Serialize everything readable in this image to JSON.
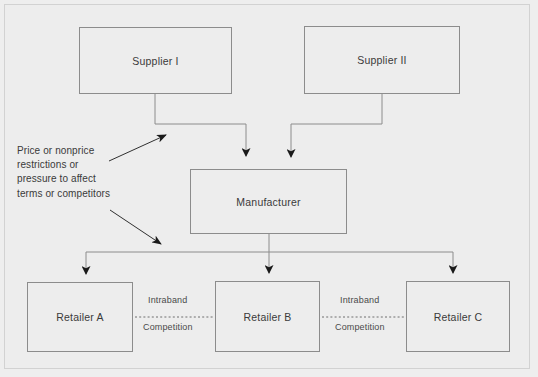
{
  "diagram": {
    "background_color": "#ededed",
    "line_color": "#8c8c8c",
    "arrow_color": "#1a1a1a",
    "text_color": "#3a3a3a"
  },
  "nodes": [
    {
      "id": "supplier-1",
      "label": "Supplier I",
      "x": 79,
      "y": 27,
      "w": 153,
      "h": 67
    },
    {
      "id": "supplier-2",
      "label": "Supplier II",
      "x": 304,
      "y": 26,
      "w": 156,
      "h": 68
    },
    {
      "id": "manufacturer",
      "label": "Manufacturer",
      "x": 190,
      "y": 169,
      "w": 157,
      "h": 65
    },
    {
      "id": "retailer-a",
      "label": "Retailer A",
      "x": 27,
      "y": 282,
      "w": 106,
      "h": 70
    },
    {
      "id": "retailer-b",
      "label": "Retailer B",
      "x": 215,
      "y": 281,
      "w": 105,
      "h": 71
    },
    {
      "id": "retailer-c",
      "label": "Retailer C",
      "x": 406,
      "y": 281,
      "w": 104,
      "h": 71
    }
  ],
  "edge_labels": [
    {
      "id": "intraband-ab-top",
      "text": "Intraband",
      "x": 148,
      "y": 295
    },
    {
      "id": "competition-ab-bottom",
      "text": "Competition",
      "x": 143,
      "y": 322
    },
    {
      "id": "intraband-bc-top",
      "text": "Intraband",
      "x": 340,
      "y": 295
    },
    {
      "id": "competition-bc-bottom",
      "text": "Competition",
      "x": 335,
      "y": 322
    }
  ],
  "annotation": {
    "id": "restriction-note",
    "lines": [
      "Price or nonprice",
      "restrictions or",
      "pressure to affect",
      "terms or competitors"
    ]
  }
}
